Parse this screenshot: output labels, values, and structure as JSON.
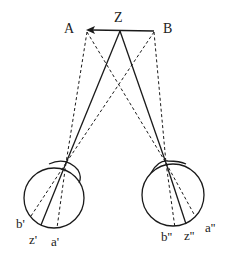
{
  "diagram": {
    "labels": {
      "A": "A",
      "Z": "Z",
      "B": "B",
      "b_left": "b'",
      "z_left": "z'",
      "a_left": "a'",
      "b_right": "b''",
      "z_right": "z''",
      "a_right": "a''"
    },
    "colors": {
      "line": "#1a1a1a",
      "background": "#ffffff"
    },
    "points": {
      "A": [
        87,
        30
      ],
      "Z": [
        120,
        31
      ],
      "B": [
        154,
        31
      ]
    },
    "eyes": [
      {
        "name": "left-eye",
        "cx": 54,
        "cy": 198,
        "r": 30
      },
      {
        "name": "right-eye",
        "cx": 173,
        "cy": 195,
        "r": 31
      }
    ]
  }
}
